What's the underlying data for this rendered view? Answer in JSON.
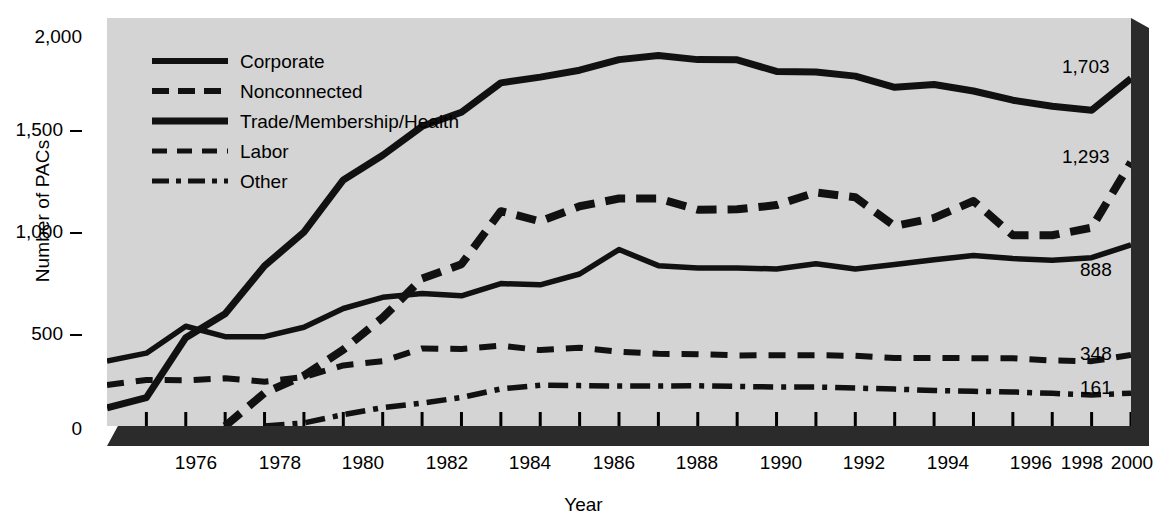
{
  "chart_data": {
    "type": "line",
    "title": "",
    "xlabel": "Year",
    "ylabel": "Number of PACs",
    "xlim": [
      1974,
      2000
    ],
    "ylim": [
      0,
      2000
    ],
    "grid": false,
    "legend_position": "upper-left-inside",
    "x": [
      1974,
      1975,
      1976,
      1977,
      1978,
      1979,
      1980,
      1981,
      1982,
      1983,
      1984,
      1985,
      1986,
      1987,
      1988,
      1989,
      1990,
      1991,
      1992,
      1993,
      1994,
      1995,
      1996,
      1997,
      1998,
      1999,
      2000
    ],
    "xtick_labels": [
      "1976",
      "1978",
      "1980",
      "1982",
      "1984",
      "1986",
      "1988",
      "1990",
      "1992",
      "1994",
      "1996",
      "1998",
      "2000"
    ],
    "xtick_values": [
      1976,
      1978,
      1980,
      1982,
      1984,
      1986,
      1988,
      1990,
      1992,
      1994,
      1996,
      1998,
      2000
    ],
    "ytick_labels": [
      "0",
      "500",
      "1,000",
      "1,500",
      "2,000"
    ],
    "ytick_values": [
      0,
      500,
      1000,
      1500,
      2000
    ],
    "series": [
      {
        "name": "Corporate",
        "style": "solid-thick",
        "end_label": "1,703",
        "values": [
          89,
          139,
          433,
          550,
          785,
          950,
          1206,
          1327,
          1469,
          1538,
          1682,
          1710,
          1744,
          1796,
          1816,
          1796,
          1795,
          1738,
          1735,
          1715,
          1660,
          1674,
          1642,
          1597,
          1567,
          1548,
          1703
        ]
      },
      {
        "name": "Nonconnected",
        "style": "dashed-thick",
        "end_label": "1,293",
        "values": [
          0,
          0,
          0,
          0,
          162,
          247,
          374,
          531,
          723,
          793,
          1053,
          1003,
          1077,
          1115,
          1115,
          1060,
          1062,
          1083,
          1145,
          1121,
          980,
          1020,
          1103,
          935,
          935,
          972,
          1293
        ]
      },
      {
        "name": "Trade/Membership/Health",
        "style": "solid-medium",
        "end_label": "888",
        "values": [
          318,
          357,
          489,
          438,
          438,
          484,
          576,
          631,
          649,
          638,
          698,
          692,
          745,
          865,
          786,
          774,
          774,
          770,
          795,
          770,
          792,
          815,
          836,
          821,
          812,
          825,
          888
        ]
      },
      {
        "name": "Labor",
        "style": "dashed-medium",
        "end_label": "348",
        "values": [
          201,
          226,
          224,
          234,
          217,
          240,
          297,
          318,
          380,
          378,
          394,
          372,
          384,
          364,
          354,
          352,
          346,
          347,
          347,
          344,
          333,
          334,
          332,
          332,
          321,
          318,
          348
        ]
      },
      {
        "name": "Other",
        "style": "dash-dot",
        "end_label": "161",
        "values": [
          0,
          0,
          0,
          0,
          0,
          15,
          56,
          90,
          112,
          140,
          182,
          200,
          198,
          196,
          196,
          197,
          194,
          191,
          191,
          186,
          181,
          174,
          170,
          167,
          160,
          152,
          161
        ]
      }
    ]
  },
  "axes": {
    "ylabel": "Number of PACs",
    "xlabel": "Year"
  },
  "legend": {
    "items": [
      {
        "label": "Corporate",
        "style": "solid-thick"
      },
      {
        "label": "Nonconnected",
        "style": "dashed-thick"
      },
      {
        "label": "Trade/Membership/Health",
        "style": "solid-medium"
      },
      {
        "label": "Labor",
        "style": "dashed-medium"
      },
      {
        "label": "Other",
        "style": "dash-dot"
      }
    ]
  },
  "colors": {
    "plot_background": "#d4d4d4",
    "page_background": "#ffffff",
    "ink": "#000000",
    "shadow": "#2b2b2b"
  }
}
